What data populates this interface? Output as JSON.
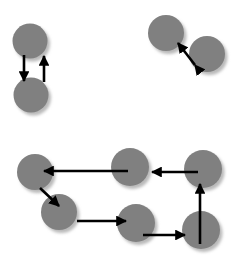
{
  "figure": {
    "title": "",
    "background_color": "#ffffff",
    "width": 232,
    "height": 263,
    "node_color": "#808080",
    "node_shadow_color": "#b9b9b9",
    "edge_color": "#000000"
  },
  "chart_data": {
    "type": "diagram",
    "title": "",
    "xlabel": "",
    "ylabel": "",
    "grid": false,
    "legend": null,
    "groups": [
      {
        "name": "top-left-pair",
        "nodes": [
          {
            "id": "tl-upper",
            "cx": 30,
            "cy": 41,
            "r": 17.5
          },
          {
            "id": "tl-lower",
            "cx": 31,
            "cy": 95,
            "r": 17.5
          }
        ],
        "edges": [
          {
            "from": "tl-upper",
            "to": "tl-lower",
            "x1": 24,
            "y1": 55,
            "x2": 24,
            "y2": 81,
            "heads": "end",
            "label": ""
          },
          {
            "from": "tl-lower",
            "to": "tl-upper",
            "x1": 44,
            "y1": 82,
            "x2": 44,
            "y2": 56,
            "heads": "end",
            "label": ""
          }
        ]
      },
      {
        "name": "top-right-pair",
        "nodes": [
          {
            "id": "tr-upper-left",
            "cx": 166,
            "cy": 33,
            "r": 18
          },
          {
            "id": "tr-lower-right",
            "cx": 207,
            "cy": 54,
            "r": 18
          }
        ],
        "edges": [
          {
            "from": "tr-lower-right",
            "to": "tr-upper-left",
            "x1": 195,
            "y1": 65,
            "x2": 178,
            "y2": 43,
            "heads": "both",
            "label": ""
          }
        ]
      },
      {
        "name": "bottom-cycle",
        "nodes": [
          {
            "id": "b-left-top",
            "cx": 35,
            "cy": 172,
            "r": 18
          },
          {
            "id": "b-left-lower",
            "cx": 59,
            "cy": 212,
            "r": 18
          },
          {
            "id": "b-mid-bottom",
            "cx": 136,
            "cy": 223,
            "r": 19
          },
          {
            "id": "b-right-bottom",
            "cx": 201,
            "cy": 230,
            "r": 19
          },
          {
            "id": "b-right-top",
            "cx": 203,
            "cy": 169,
            "r": 19
          },
          {
            "id": "b-mid-top",
            "cx": 130,
            "cy": 167,
            "r": 19
          }
        ],
        "edges": [
          {
            "from": "b-mid-top",
            "to": "b-left-top",
            "x1": 128,
            "y1": 171,
            "x2": 44,
            "y2": 171,
            "heads": "end",
            "label": ""
          },
          {
            "from": "b-right-top",
            "to": "b-mid-top",
            "x1": 198,
            "y1": 172,
            "x2": 152,
            "y2": 172,
            "heads": "end",
            "label": ""
          },
          {
            "from": "b-left-top",
            "to": "b-left-lower",
            "x1": 40,
            "y1": 188,
            "x2": 59,
            "y2": 206,
            "heads": "end",
            "label": ""
          },
          {
            "from": "b-left-lower",
            "to": "b-mid-bottom",
            "x1": 77,
            "y1": 221,
            "x2": 126,
            "y2": 221,
            "heads": "end",
            "label": ""
          },
          {
            "from": "b-mid-bottom",
            "to": "b-right-bottom",
            "x1": 143,
            "y1": 235,
            "x2": 185,
            "y2": 235,
            "heads": "end",
            "label": ""
          },
          {
            "from": "b-right-bottom",
            "to": "b-right-top",
            "x1": 200,
            "y1": 244,
            "x2": 200,
            "y2": 184,
            "heads": "end",
            "label": ""
          }
        ]
      }
    ]
  }
}
